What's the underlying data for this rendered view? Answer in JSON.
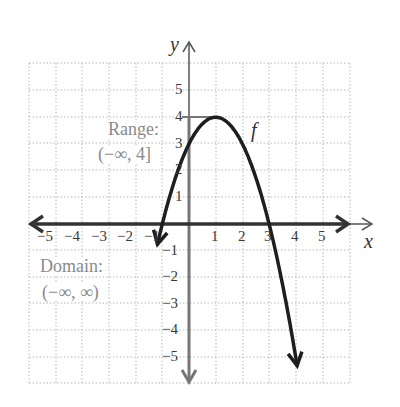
{
  "chart_data": {
    "type": "line",
    "title": "",
    "xlabel": "x",
    "ylabel": "y",
    "function_label": "f",
    "function": "f(x) = -(x - 1)^2 + 4",
    "xlim": [
      -6,
      6
    ],
    "ylim": [
      -6,
      6
    ],
    "grid": true,
    "x_ticks": [
      "-5",
      "-4",
      "-3",
      "-2",
      "-1",
      "1",
      "2",
      "3",
      "4",
      "5"
    ],
    "y_ticks": [
      "5",
      "4",
      "3",
      "2",
      "1",
      "-1",
      "-2",
      "-3",
      "-4",
      "-5"
    ],
    "series": [
      {
        "name": "f",
        "x": [
          -1.6,
          -1,
          0,
          1,
          2,
          3,
          4,
          4.2
        ],
        "y": [
          -2.76,
          0,
          3,
          4,
          -1,
          0,
          -5,
          -6.24
        ]
      }
    ],
    "key_points": {
      "vertex": [
        1,
        4
      ],
      "x_intercepts": [
        -1,
        3
      ],
      "y_intercept": 3
    },
    "annotations": [
      {
        "text": "Range:",
        "value": "(−∞, 4]"
      },
      {
        "text": "Domain:",
        "value": "(−∞, ∞)"
      }
    ]
  },
  "labels": {
    "x_axis": "x",
    "y_axis": "y",
    "f": "f",
    "range_title": "Range:",
    "range_value": "(−∞, 4]",
    "domain_title": "Domain:",
    "domain_value": "(−∞, ∞)",
    "xt": [
      "−5",
      "−4",
      "−3",
      "−2",
      "−1",
      "1",
      "2",
      "3",
      "4",
      "5"
    ],
    "yt": [
      "5",
      "4",
      "3",
      "2",
      "1",
      "−1",
      "−2",
      "−3",
      "−4",
      "−5"
    ]
  }
}
